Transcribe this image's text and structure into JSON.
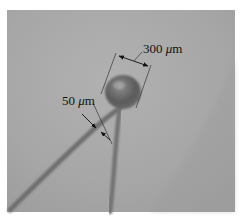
{
  "figure": {
    "type": "grayscale micrograph",
    "background_color": "#a9a9a9",
    "annotations": [
      {
        "id": "sphere-diameter",
        "value": "300",
        "unit_prefix": "μ",
        "unit": "m",
        "text": "300 μm"
      },
      {
        "id": "wire-diameter",
        "value": "50",
        "unit_prefix": "μ",
        "unit": "m",
        "text": "50 μm"
      }
    ]
  }
}
